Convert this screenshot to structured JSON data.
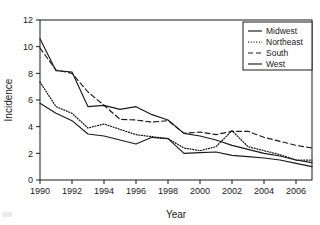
{
  "figure": {
    "background_color": "#ffffff",
    "line_color": "#1a1a1a"
  },
  "axes": {
    "x_title": "Year",
    "y_title": "Incidence",
    "x_tick_labels": [
      "1990",
      "1992",
      "1994",
      "1996",
      "1998",
      "2000",
      "2002",
      "2004",
      "2006"
    ],
    "y_tick_labels": [
      "0",
      "2",
      "4",
      "6",
      "8",
      "10",
      "12"
    ]
  },
  "legend": {
    "items": [
      {
        "label": "Midwest",
        "style": "solid"
      },
      {
        "label": "Northeast",
        "style": "dotted"
      },
      {
        "label": "South",
        "style": "dashed"
      },
      {
        "label": "West",
        "style": "solid"
      }
    ]
  },
  "chart_data": {
    "type": "line",
    "title": "",
    "subtitle": "",
    "xlabel": "Year",
    "ylabel": "Incidence",
    "xlim": [
      1990,
      2007
    ],
    "ylim": [
      0,
      12
    ],
    "grid": false,
    "legend_position": "top-right",
    "x": [
      1990,
      1991,
      1992,
      1993,
      1994,
      1995,
      1996,
      1997,
      1998,
      1999,
      2000,
      2001,
      2002,
      2003,
      2004,
      2005,
      2006,
      2007
    ],
    "x_ticks": [
      1990,
      1992,
      1994,
      1996,
      1998,
      2000,
      2002,
      2004,
      2006
    ],
    "y_ticks": [
      0,
      2,
      4,
      6,
      8,
      10,
      12
    ],
    "series": [
      {
        "name": "Midwest",
        "style": "solid",
        "values": [
          10.6,
          8.2,
          8.1,
          5.5,
          5.6,
          5.3,
          5.5,
          4.9,
          4.5,
          3.5,
          3.3,
          3.0,
          2.6,
          2.3,
          2.0,
          1.8,
          1.5,
          1.3
        ]
      },
      {
        "name": "Northeast",
        "style": "dotted",
        "values": [
          7.35,
          5.5,
          5.0,
          3.9,
          4.2,
          3.8,
          3.4,
          3.25,
          3.1,
          2.4,
          2.2,
          2.5,
          3.7,
          2.5,
          2.2,
          1.9,
          1.5,
          1.5
        ]
      },
      {
        "name": "South",
        "style": "dashed",
        "values": [
          9.9,
          8.25,
          8.0,
          6.6,
          5.6,
          4.55,
          4.5,
          4.35,
          4.45,
          3.5,
          3.6,
          3.4,
          3.65,
          3.65,
          3.2,
          2.9,
          2.6,
          2.4
        ]
      },
      {
        "name": "West",
        "style": "solid",
        "values": [
          5.75,
          5.0,
          4.45,
          3.45,
          3.3,
          3.0,
          2.7,
          3.2,
          3.1,
          2.0,
          2.05,
          2.1,
          1.85,
          1.75,
          1.65,
          1.5,
          1.25,
          1.0
        ]
      }
    ]
  }
}
